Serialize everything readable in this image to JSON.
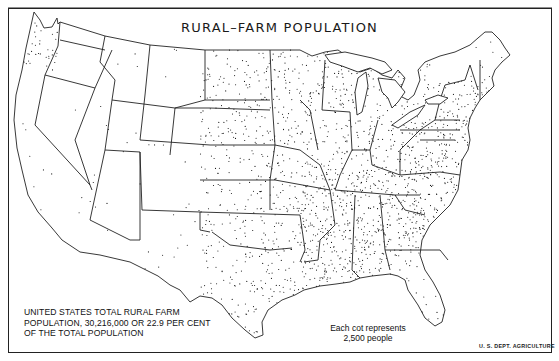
{
  "map": {
    "title": "RURAL–FARM POPULATION",
    "summary_note": {
      "line1": "UNITED STATES TOTAL RURAL  FARM",
      "line2": "POPULATION, 30,216,000 OR 22.9 PER CENT",
      "line3": "OF THE TOTAL POPULATION"
    },
    "legend": {
      "line1": "Each cot represents",
      "line2": "2,500 people"
    },
    "credit": "U. S. DEPT. AGRICULTURE",
    "dot_value": 2500,
    "total_rural_farm_population": 30216000,
    "percent_of_total": 22.9,
    "colors": {
      "ink": "#111111",
      "background": "#ffffff",
      "border": "#222222"
    }
  }
}
